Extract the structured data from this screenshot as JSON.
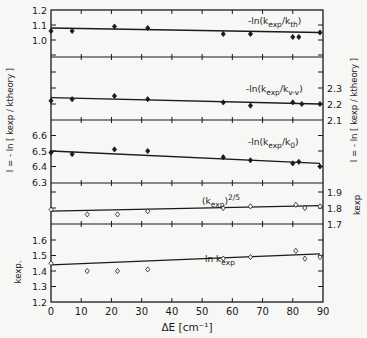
{
  "chart_data": [
    {
      "type": "scatter",
      "panel": 1,
      "label": "-ln(k_exp/k_th)",
      "label_parts": {
        "pre": "-ln(k",
        "sub1": "exp",
        "mid": "/k",
        "sub2": "th",
        "post": ")"
      },
      "axis": "left",
      "yticks": [
        1.0,
        1.1,
        1.2
      ],
      "ylim": [
        0.9,
        1.2
      ],
      "marker": "filled-diamond",
      "x": [
        0,
        7,
        21,
        32,
        57,
        66,
        80,
        82,
        89
      ],
      "y": [
        1.06,
        1.06,
        1.09,
        1.08,
        1.04,
        1.04,
        1.02,
        1.02,
        1.05
      ],
      "fit": {
        "x": [
          0,
          89
        ],
        "y": [
          1.08,
          1.05
        ]
      }
    },
    {
      "type": "scatter",
      "panel": 2,
      "label": "-ln(k_exp/k_v-v)",
      "label_parts": {
        "pre": "-ln(k",
        "sub1": "exp",
        "mid": "/k",
        "sub2": "v-v",
        "post": ")"
      },
      "axis": "right",
      "yticks": [
        2.1,
        2.2,
        2.3
      ],
      "ylim": [
        2.1,
        2.5
      ],
      "marker": "filled-diamond",
      "x": [
        0,
        7,
        21,
        32,
        57,
        66,
        80,
        83,
        89
      ],
      "y": [
        2.22,
        2.23,
        2.25,
        2.23,
        2.21,
        2.19,
        2.21,
        2.2,
        2.2
      ],
      "fit": {
        "x": [
          0,
          89
        ],
        "y": [
          2.24,
          2.2
        ]
      }
    },
    {
      "type": "scatter",
      "panel": 3,
      "label": "-ln(k_exp/k_0)",
      "label_parts": {
        "pre": "-ln(k",
        "sub1": "exp",
        "mid": "/k",
        "sub2": "0",
        "post": ")"
      },
      "axis": "left",
      "yticks": [
        6.3,
        6.4,
        6.5,
        6.6
      ],
      "ylim": [
        6.3,
        6.7
      ],
      "marker": "filled-diamond",
      "x": [
        0,
        7,
        21,
        32,
        57,
        66,
        80,
        82,
        89
      ],
      "y": [
        6.49,
        6.48,
        6.51,
        6.5,
        6.46,
        6.44,
        6.42,
        6.43,
        6.4
      ],
      "fit": {
        "x": [
          0,
          89
        ],
        "y": [
          6.5,
          6.42
        ]
      }
    },
    {
      "type": "scatter",
      "panel": 4,
      "label": "(k_exp)^2/5",
      "label_parts": {
        "pre": "(k",
        "sub1": "exp",
        "post": ")",
        "sup": "2/5"
      },
      "axis": "right",
      "yticks": [
        1.7,
        1.8,
        1.9
      ],
      "ylim": [
        1.7,
        1.95
      ],
      "marker": "open-diamond",
      "x": [
        0,
        12,
        22,
        32,
        57,
        66,
        81,
        84,
        89
      ],
      "y": [
        1.79,
        1.76,
        1.76,
        1.78,
        1.8,
        1.81,
        1.82,
        1.8,
        1.81
      ],
      "fit": {
        "x": [
          0,
          89
        ],
        "y": [
          1.78,
          1.815
        ]
      }
    },
    {
      "type": "scatter",
      "panel": 5,
      "label": "ln k_exp",
      "label_parts": {
        "pre": "ln k",
        "sub1": "exp"
      },
      "axis": "left",
      "yticks": [
        1.2,
        1.3,
        1.4,
        1.5,
        1.6
      ],
      "ylim": [
        1.2,
        1.7
      ],
      "marker": "open-diamond",
      "x": [
        0,
        12,
        22,
        32,
        57,
        66,
        81,
        84,
        89
      ],
      "y": [
        1.45,
        1.4,
        1.4,
        1.41,
        1.48,
        1.49,
        1.53,
        1.48,
        1.49
      ],
      "fit": {
        "x": [
          0,
          89
        ],
        "y": [
          1.44,
          1.51
        ]
      }
    }
  ],
  "axes": {
    "xlabel": "ΔE [cm⁻¹]",
    "xticks": [
      0,
      10,
      20,
      30,
      40,
      50,
      60,
      70,
      80,
      90
    ],
    "xlim": [
      0,
      90
    ],
    "left_ylabel_upper": "I = -ln [ k_exp / k_theory ]",
    "left_ylabel_lower": "k_exp.",
    "right_ylabel_upper": "I = -ln [ k_exp / k_theory ]",
    "right_ylabel_lower": "k_exp"
  },
  "text": {
    "xlabel": "ΔE [cm⁻¹]",
    "left_upper_axis_label": "I = - ln [ kexp / ktheory ]",
    "left_lower_axis_label": "kexp.",
    "right_upper_axis_label": "I = - ln [ kexp / ktheory ]",
    "right_lower_axis_label": "kexp"
  }
}
